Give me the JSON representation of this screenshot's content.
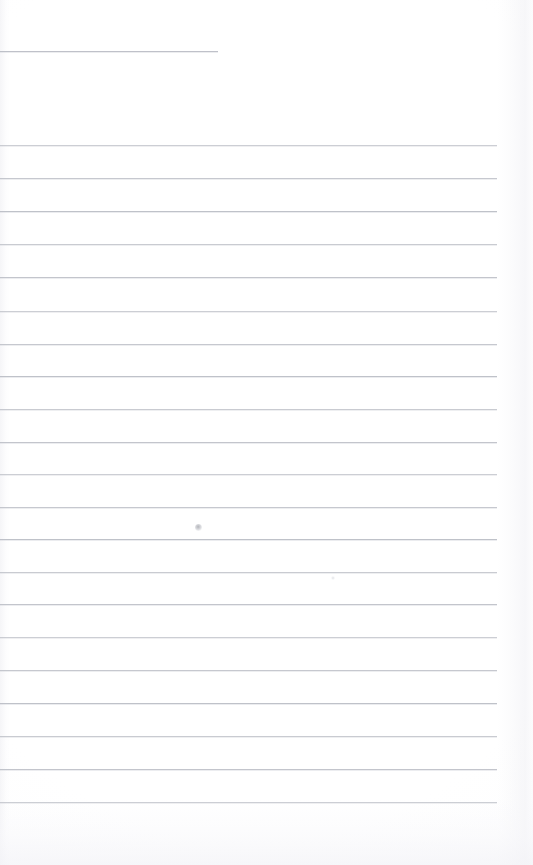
{
  "document": {
    "kind": "scanned-lined-paper",
    "title": "Blank Ruled Notebook Page",
    "page_width": 533,
    "page_height": 865,
    "background_color": "#ffffff",
    "rule_color": "#b9bcc4",
    "content_text": "",
    "has_handwriting": false,
    "has_printed_text": false
  },
  "header_rule": {
    "label": "header-rule",
    "y": 51,
    "x_start": 0,
    "x_end": 218,
    "length": 218,
    "color": "#b4b7c0"
  },
  "ruled_lines": {
    "count": 21,
    "x_start": 0,
    "x_end": 497,
    "spacing": 32.8,
    "color": "#b9bcc4",
    "positions": [
      145,
      178,
      211,
      244,
      277,
      311,
      344,
      376,
      409,
      442,
      474,
      507,
      539,
      572,
      604,
      637,
      670,
      703,
      736,
      769,
      802
    ]
  },
  "marks": [
    {
      "label": "smudge-upper",
      "x": 198,
      "y": 527,
      "size": 7,
      "style": "smudge"
    },
    {
      "label": "speck-lower",
      "x": 333,
      "y": 578,
      "size": 4,
      "style": "faint"
    }
  ],
  "regions": {
    "top_margin_label": "top-margin",
    "top_margin_height": 51,
    "gap_after_header_label": "header-gap",
    "gap_after_header_height": 94,
    "bottom_margin_label": "bottom-margin",
    "bottom_margin_height": 63
  }
}
